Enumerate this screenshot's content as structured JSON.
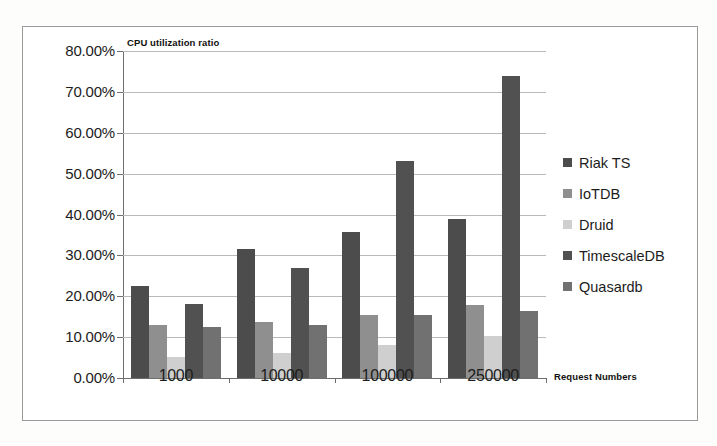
{
  "chart_data": {
    "type": "bar",
    "title": "CPU utilization ratio",
    "xlabel": "Request Numbers",
    "ylabel": "",
    "categories": [
      "1000",
      "10000",
      "100000",
      "250000"
    ],
    "ytick_labels": [
      "80.00%",
      "70.00%",
      "60.00%",
      "50.00%",
      "40.00%",
      "30.00%",
      "20.00%",
      "10.00%",
      "0.00%"
    ],
    "ytick_values": [
      80,
      70,
      60,
      50,
      40,
      30,
      20,
      10,
      0
    ],
    "ylim": [
      0,
      80
    ],
    "grid": true,
    "legend_position": "right",
    "value_unit": "percent",
    "series": [
      {
        "name": "Riak TS",
        "color": "#4c4c4c",
        "values": [
          22.5,
          31.5,
          35.8,
          38.9
        ]
      },
      {
        "name": "IoTDB",
        "color": "#8f8f8f",
        "values": [
          12.9,
          13.7,
          15.5,
          17.9
        ]
      },
      {
        "name": "Druid",
        "color": "#cfcfcf",
        "values": [
          5.1,
          6.0,
          8.1,
          10.3
        ]
      },
      {
        "name": "TimescaleDB",
        "color": "#515151",
        "values": [
          18.0,
          26.8,
          53.2,
          74.0
        ]
      },
      {
        "name": "Quasardb",
        "color": "#717171",
        "values": [
          12.5,
          12.9,
          15.3,
          16.4
        ]
      }
    ]
  },
  "frame": {
    "border_color": "#9a9a9a",
    "axis_color": "#6e6e6e",
    "grid_color": "#b9b9b9"
  }
}
